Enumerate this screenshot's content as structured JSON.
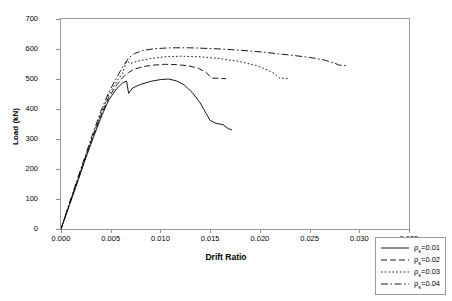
{
  "chart_data": {
    "type": "line",
    "title": "",
    "xlabel": "Drift Ratio",
    "ylabel": "Load (kN)",
    "xlim": [
      0.0,
      0.035
    ],
    "ylim": [
      0,
      700
    ],
    "xticks": [
      "0.000",
      "0.005",
      "0.010",
      "0.015",
      "0.020",
      "0.025",
      "0.030",
      "0.035"
    ],
    "xtick_values": [
      0.0,
      0.005,
      0.01,
      0.015,
      0.02,
      0.025,
      0.03,
      0.035
    ],
    "yticks": [
      "0",
      "100",
      "200",
      "300",
      "400",
      "500",
      "600",
      "700"
    ],
    "ytick_values": [
      0,
      100,
      200,
      300,
      400,
      500,
      600,
      700
    ],
    "grid": false,
    "legend_position": "bottom-right",
    "series": [
      {
        "name": "rho=0.01",
        "label_prefix": "ρ",
        "label_sub": "s",
        "label_suffix": "=0.01",
        "style": "solid",
        "color": "#000000",
        "points": [
          [
            0.0,
            0
          ],
          [
            0.0008,
            75
          ],
          [
            0.0016,
            150
          ],
          [
            0.0024,
            228
          ],
          [
            0.0032,
            300
          ],
          [
            0.004,
            370
          ],
          [
            0.0048,
            430
          ],
          [
            0.0056,
            468
          ],
          [
            0.0062,
            487
          ],
          [
            0.0066,
            493
          ],
          [
            0.0068,
            452
          ],
          [
            0.0072,
            470
          ],
          [
            0.008,
            482
          ],
          [
            0.009,
            492
          ],
          [
            0.01,
            498
          ],
          [
            0.0108,
            500
          ],
          [
            0.0116,
            494
          ],
          [
            0.0124,
            480
          ],
          [
            0.0132,
            455
          ],
          [
            0.014,
            420
          ],
          [
            0.0146,
            385
          ],
          [
            0.015,
            362
          ],
          [
            0.0156,
            352
          ],
          [
            0.0163,
            348
          ],
          [
            0.0168,
            335
          ],
          [
            0.0172,
            330
          ]
        ]
      },
      {
        "name": "rho=0.02",
        "label_prefix": "ρ",
        "label_sub": "s",
        "label_suffix": "=0.02",
        "style": "dashed",
        "color": "#000000",
        "points": [
          [
            0.0,
            0
          ],
          [
            0.0008,
            78
          ],
          [
            0.0016,
            155
          ],
          [
            0.0024,
            232
          ],
          [
            0.0032,
            308
          ],
          [
            0.004,
            378
          ],
          [
            0.0048,
            438
          ],
          [
            0.0056,
            480
          ],
          [
            0.0062,
            505
          ],
          [
            0.0068,
            522
          ],
          [
            0.0074,
            533
          ],
          [
            0.0082,
            541
          ],
          [
            0.0092,
            546
          ],
          [
            0.0104,
            549
          ],
          [
            0.0116,
            548
          ],
          [
            0.0128,
            544
          ],
          [
            0.0138,
            536
          ],
          [
            0.0146,
            522
          ],
          [
            0.015,
            508
          ],
          [
            0.0152,
            503
          ],
          [
            0.016,
            502
          ],
          [
            0.0166,
            501
          ]
        ]
      },
      {
        "name": "rho=0.03",
        "label_prefix": "ρ",
        "label_sub": "s",
        "label_suffix": "=0.03",
        "style": "dotted",
        "color": "#000000",
        "points": [
          [
            0.0,
            0
          ],
          [
            0.0008,
            80
          ],
          [
            0.0016,
            158
          ],
          [
            0.0024,
            236
          ],
          [
            0.0032,
            312
          ],
          [
            0.004,
            384
          ],
          [
            0.0048,
            446
          ],
          [
            0.0056,
            492
          ],
          [
            0.0062,
            520
          ],
          [
            0.0066,
            560
          ],
          [
            0.007,
            552
          ],
          [
            0.0078,
            560
          ],
          [
            0.009,
            568
          ],
          [
            0.0104,
            574
          ],
          [
            0.012,
            576
          ],
          [
            0.014,
            574
          ],
          [
            0.016,
            568
          ],
          [
            0.018,
            558
          ],
          [
            0.0196,
            545
          ],
          [
            0.0208,
            530
          ],
          [
            0.0216,
            515
          ],
          [
            0.022,
            503
          ],
          [
            0.0226,
            502
          ],
          [
            0.023,
            500
          ]
        ]
      },
      {
        "name": "rho=0.04",
        "label_prefix": "ρ",
        "label_sub": "s",
        "label_suffix": "=0.04",
        "style": "dashdot",
        "color": "#000000",
        "points": [
          [
            0.0,
            0
          ],
          [
            0.0008,
            82
          ],
          [
            0.0016,
            162
          ],
          [
            0.0024,
            240
          ],
          [
            0.0032,
            318
          ],
          [
            0.004,
            392
          ],
          [
            0.0048,
            455
          ],
          [
            0.0056,
            505
          ],
          [
            0.0062,
            540
          ],
          [
            0.0068,
            570
          ],
          [
            0.0074,
            585
          ],
          [
            0.0082,
            595
          ],
          [
            0.0094,
            601
          ],
          [
            0.011,
            604
          ],
          [
            0.013,
            604
          ],
          [
            0.0155,
            601
          ],
          [
            0.018,
            596
          ],
          [
            0.0205,
            589
          ],
          [
            0.023,
            580
          ],
          [
            0.025,
            572
          ],
          [
            0.0265,
            563
          ],
          [
            0.0275,
            553
          ],
          [
            0.028,
            546
          ],
          [
            0.0288,
            545
          ]
        ]
      }
    ]
  },
  "axes": {
    "xlabel": "Drift Ratio",
    "ylabel": "Load (kN)"
  }
}
